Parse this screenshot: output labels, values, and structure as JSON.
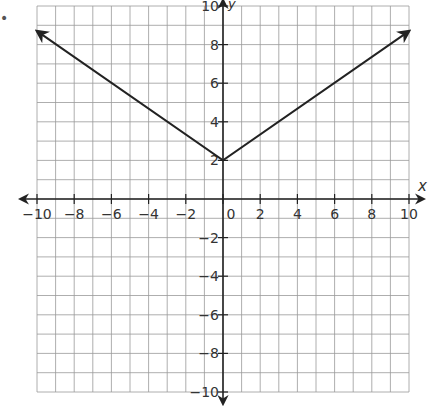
{
  "chart_data": {
    "type": "line",
    "title": "",
    "xlabel": "x",
    "ylabel": "y",
    "xlim": [
      -10,
      10
    ],
    "ylim": [
      -10,
      10
    ],
    "grid": true,
    "x_ticks": [
      "-10",
      "-8",
      "-6",
      "-4",
      "-2",
      "0",
      "2",
      "4",
      "6",
      "8",
      "10"
    ],
    "y_ticks": [
      "10",
      "8",
      "6",
      "4",
      "2",
      "-2",
      "-4",
      "-6",
      "-8",
      "-10"
    ],
    "series": [
      {
        "name": "absolute value function",
        "points": [
          [
            -10,
            8.7
          ],
          [
            0,
            2
          ],
          [
            10,
            8.7
          ]
        ],
        "arrows": "both ends"
      }
    ],
    "vertex": [
      0,
      2
    ],
    "function": "y = (2/3)|x| + 2"
  },
  "colors": {
    "grid": "#999999",
    "axis": "#222222",
    "line": "#222222"
  },
  "bullet": "•"
}
